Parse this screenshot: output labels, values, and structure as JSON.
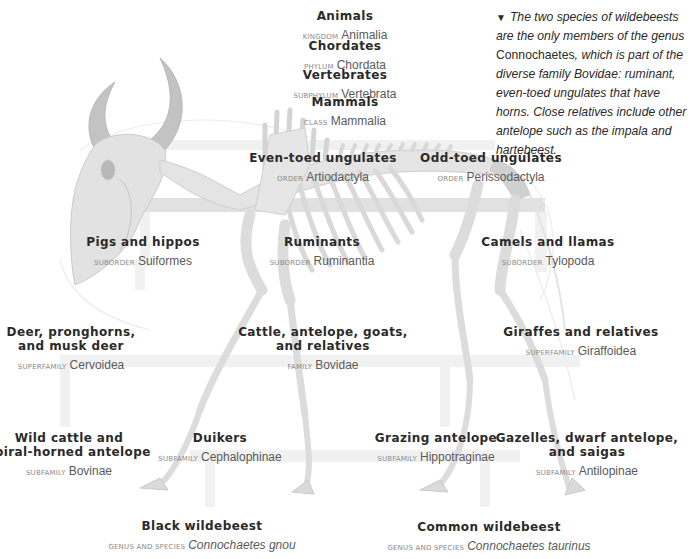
{
  "caption": {
    "marker": "▼",
    "text_before": "The two species of wildebeests are the only members of the genus ",
    "genus": "Connochaetes",
    "text_after": ", which is part of the diverse family Bovidae: ruminant, even-toed ungulates that have horns. Close relatives include other antelope such as the impala and hartebeest."
  },
  "illustration": {
    "subject": "wildebeest skeleton",
    "colors": {
      "bone": "#e6e6e6",
      "bone_outline": "#cfcfcf",
      "horn": "#bdbdbd",
      "connector": "#f1f1f1",
      "connector_dark": "#d9d9d9",
      "text": "#2a2a2a",
      "rank": "#8a8a8a",
      "sci": "#5a5a5a"
    }
  },
  "taxonomy": {
    "kingdom": {
      "common": "Animals",
      "rank": "Kingdom",
      "name": "Animalia"
    },
    "phylum": {
      "common": "Chordates",
      "rank": "Phylum",
      "name": "Chordata"
    },
    "subphylum": {
      "common": "Vertebrates",
      "rank": "Subphylum",
      "name": "Vertebrata"
    },
    "class": {
      "common": "Mammals",
      "rank": "Class",
      "name": "Mammalia"
    },
    "order_even": {
      "common": "Even-toed ungulates",
      "rank": "Order",
      "name": "Artiodactyla"
    },
    "order_odd": {
      "common": "Odd-toed ungulates",
      "rank": "Order",
      "name": "Perissodactyla"
    },
    "suborder_pigs": {
      "common": "Pigs and hippos",
      "rank": "Suborder",
      "name": "Suiformes"
    },
    "suborder_rum": {
      "common": "Ruminants",
      "rank": "Suborder",
      "name": "Ruminantia"
    },
    "suborder_camel": {
      "common": "Camels and llamas",
      "rank": "Suborder",
      "name": "Tylopoda"
    },
    "superfamily_deer": {
      "common_line1": "Deer, pronghorns,",
      "common_line2": "and musk deer",
      "rank": "Superfamily",
      "name": "Cervoidea"
    },
    "family_bovidae": {
      "common_line1": "Cattle, antelope, goats,",
      "common_line2": "and relatives",
      "rank": "Family",
      "name": "Bovidae"
    },
    "superfamily_giraffe": {
      "common": "Giraffes and relatives",
      "rank": "Superfamily",
      "name": "Giraffoidea"
    },
    "subfamily_bovinae": {
      "common_line1": "Wild cattle and",
      "common_line2": "spiral-horned antelope",
      "rank": "Subfamily",
      "name": "Bovinae"
    },
    "subfamily_duikers": {
      "common": "Duikers",
      "rank": "Subfamily",
      "name": "Cephalophinae"
    },
    "subfamily_grazing": {
      "common": "Grazing antelope",
      "rank": "Subfamily",
      "name": "Hippotraginae"
    },
    "subfamily_antilopinae": {
      "common_line1": "Gazelles, dwarf antelope,",
      "common_line2": "and saigas",
      "rank": "Subfamily",
      "name": "Antilopinae"
    },
    "species_black": {
      "common": "Black wildebeest",
      "rank": "Genus and species",
      "name": "Connochaetes gnou"
    },
    "species_common": {
      "common": "Common wildebeest",
      "rank": "Genus and species",
      "name": "Connochaetes taurinus"
    }
  }
}
